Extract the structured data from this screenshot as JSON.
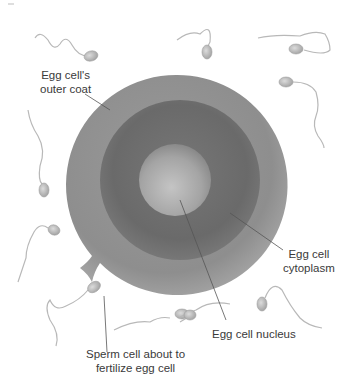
{
  "diagram": {
    "type": "labeled biological illustration",
    "labels": {
      "outer_coat": [
        "Egg cell's",
        "outer coat"
      ],
      "cytoplasm": [
        "Egg cell",
        "cytoplasm"
      ],
      "nucleus": [
        "Egg cell nucleus"
      ],
      "sperm": [
        "Sperm cell about to",
        "fertilize egg cell"
      ]
    },
    "structures": [
      {
        "name": "outer coat",
        "shape": "circle",
        "center": [
          177,
          185
        ],
        "radius": 110,
        "color": "#8c8c8c"
      },
      {
        "name": "cytoplasm",
        "shape": "circle",
        "center": [
          180,
          180
        ],
        "radius": 80,
        "color": "#6f6f6f"
      },
      {
        "name": "nucleus",
        "shape": "circle",
        "center": [
          175,
          180
        ],
        "radius": 36,
        "color": "#a8a8a8"
      }
    ],
    "sperm_count": 10,
    "colors": {
      "background": "#ffffff",
      "outer_coat": "#8c8c8c",
      "cytoplasm": "#6e6e6e",
      "nucleus": "#b0b0b0",
      "sperm": "#b8b8b8",
      "leader_line": "#555555",
      "text": "#3a3a3a"
    }
  }
}
